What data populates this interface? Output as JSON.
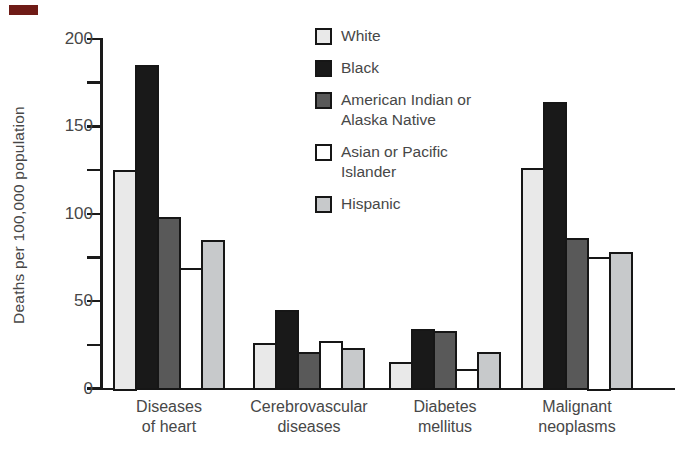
{
  "chart_data": {
    "type": "bar",
    "title": "",
    "xlabel": "",
    "ylabel": "Deaths per 100,000 population",
    "categories": [
      [
        "Diseases",
        "of heart"
      ],
      [
        "Cerebrovascular",
        "diseases"
      ],
      [
        "Diabetes",
        "mellitus"
      ],
      [
        "Malignant",
        "neoplasms"
      ]
    ],
    "series": [
      {
        "name": "White",
        "legend_lines": [
          "White"
        ],
        "color": "#e9e9e9",
        "values": [
          125,
          26,
          15,
          126
        ]
      },
      {
        "name": "Black",
        "legend_lines": [
          "Black"
        ],
        "color": "#191919",
        "values": [
          185,
          45,
          34,
          164
        ]
      },
      {
        "name": "American Indian or Alaska Native",
        "legend_lines": [
          "American Indian or",
          "Alaska Native"
        ],
        "color": "#595959",
        "values": [
          98,
          21,
          33,
          86
        ]
      },
      {
        "name": "Asian or Pacific Islander",
        "legend_lines": [
          "Asian or Pacific",
          "Islander"
        ],
        "color": "#ffffff",
        "values": [
          69,
          27,
          11,
          75
        ]
      },
      {
        "name": "Hispanic",
        "legend_lines": [
          "Hispanic"
        ],
        "color": "#c7c9cb",
        "values": [
          85,
          23,
          21,
          78
        ]
      }
    ],
    "ylim": [
      0,
      200
    ],
    "yticks_labeled": [
      0,
      50,
      100,
      150,
      200
    ],
    "yticks_minor": [
      25,
      75,
      125,
      175
    ],
    "legend_position": "top-center",
    "grid": false,
    "axis_color": "#1a1a1a",
    "text_color": "#474747"
  },
  "artifacts": {
    "corner_mark_color": "#6f1b16"
  }
}
